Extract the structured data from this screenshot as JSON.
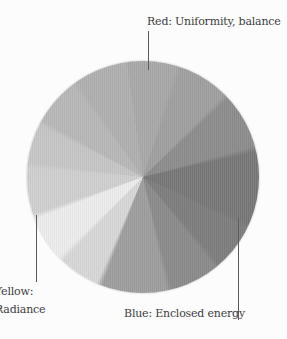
{
  "figure": {
    "background": "#fcfcfc",
    "ink_color": "#3d3d3d",
    "leader_line_color": "#5a5a5a"
  },
  "annotations": {
    "red": {
      "label": "Red: Uniformity, balance",
      "target_angle_deg": 5
    },
    "yellow": {
      "line1": "Yellow:",
      "line2": "Radiance",
      "target_angle_deg": 250
    },
    "blue": {
      "label": "Blue: Enclosed energy",
      "target_angle_deg": 112
    }
  },
  "chart_data": {
    "type": "pie",
    "center_px": {
      "x": 143,
      "y": 177
    },
    "radius_px": 116,
    "segments": [
      {
        "from_deg": -8,
        "to_deg": 18,
        "gray": "#a9a9a9",
        "label": "red"
      },
      {
        "from_deg": 18,
        "to_deg": 46,
        "gray": "#a0a0a0",
        "label": ""
      },
      {
        "from_deg": 46,
        "to_deg": 76,
        "gray": "#8d8d8d",
        "label": ""
      },
      {
        "from_deg": 76,
        "to_deg": 115,
        "gray": "#787878",
        "label": "blue"
      },
      {
        "from_deg": 115,
        "to_deg": 140,
        "gray": "#7e7e7e",
        "label": ""
      },
      {
        "from_deg": 140,
        "to_deg": 167,
        "gray": "#8b8b8b",
        "label": ""
      },
      {
        "from_deg": 167,
        "to_deg": 202,
        "gray": "#9e9e9e",
        "label": ""
      },
      {
        "from_deg": 202,
        "to_deg": 225,
        "gray": "#d8d8d8",
        "label": ""
      },
      {
        "from_deg": 225,
        "to_deg": 250,
        "gray": "#ededed",
        "label": ""
      },
      {
        "from_deg": 250,
        "to_deg": 276,
        "gray": "#d0d0d0",
        "label": "yellow"
      },
      {
        "from_deg": 276,
        "to_deg": 298,
        "gray": "#c7c7c7",
        "label": ""
      },
      {
        "from_deg": 298,
        "to_deg": 324,
        "gray": "#b8b8b8",
        "label": ""
      },
      {
        "from_deg": 324,
        "to_deg": 352,
        "gray": "#b0b0b0",
        "label": ""
      }
    ]
  }
}
